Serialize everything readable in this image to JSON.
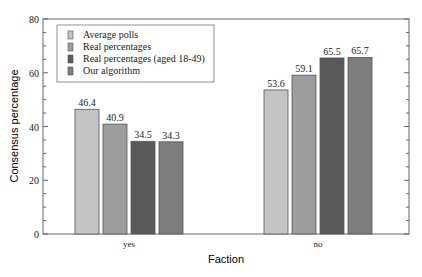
{
  "chart_data": {
    "type": "bar",
    "title": "",
    "xlabel": "Faction",
    "ylabel": "Consensus percentage",
    "ylim": [
      0,
      80
    ],
    "yticks": [
      0,
      20,
      40,
      60,
      80
    ],
    "grid": false,
    "legend_position": "upper left",
    "categories": [
      "yes",
      "no"
    ],
    "series": [
      {
        "name": "Average polls",
        "values": [
          46.4,
          53.6
        ],
        "color": "#c4c4c4"
      },
      {
        "name": "Real percentages",
        "values": [
          40.9,
          59.1
        ],
        "color": "#9d9d9d"
      },
      {
        "name": "Real percentages (aged 18-49)",
        "values": [
          34.5,
          65.5
        ],
        "color": "#595959"
      },
      {
        "name": "Our algorithm",
        "values": [
          34.3,
          65.7
        ],
        "color": "#7d7d7d"
      }
    ],
    "value_labels": [
      [
        "46.4",
        "53.6"
      ],
      [
        "40.9",
        "59.1"
      ],
      [
        "34.5",
        "65.5"
      ],
      [
        "34.3",
        "65.7"
      ]
    ]
  }
}
